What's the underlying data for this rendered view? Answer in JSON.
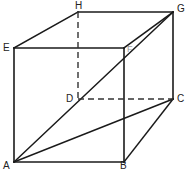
{
  "figure": {
    "background_color": "#ffffff",
    "stroke_color": "#1a1a1a",
    "dashed_stroke_color": "#333333",
    "width": 187,
    "height": 171
  },
  "labels": {
    "A": "A",
    "B": "B",
    "C": "C",
    "D": "D",
    "E": "E",
    "F": "F",
    "G": "G",
    "H": "H"
  },
  "chart_data": {
    "type": "diagram",
    "vertices": [
      {
        "name": "A",
        "x": 14,
        "y": 162,
        "hidden": false,
        "label_x": 3,
        "label_y": 161
      },
      {
        "name": "B",
        "x": 124,
        "y": 162,
        "hidden": false,
        "label_x": 120,
        "label_y": 161
      },
      {
        "name": "C",
        "x": 173,
        "y": 99,
        "hidden": false,
        "label_x": 177,
        "label_y": 94
      },
      {
        "name": "D",
        "x": 78,
        "y": 99,
        "hidden": true,
        "label_x": 66,
        "label_y": 94
      },
      {
        "name": "E",
        "x": 14,
        "y": 48,
        "hidden": false,
        "label_x": 3,
        "label_y": 43
      },
      {
        "name": "F",
        "x": 124,
        "y": 48,
        "hidden": false,
        "label_x": 127,
        "label_y": 44
      },
      {
        "name": "G",
        "x": 173,
        "y": 12,
        "hidden": false,
        "label_x": 177,
        "label_y": 4
      },
      {
        "name": "H",
        "x": 78,
        "y": 12,
        "hidden": false,
        "label_x": 75,
        "label_y": 1
      }
    ],
    "edges": [
      {
        "from": "A",
        "to": "B",
        "style": "solid"
      },
      {
        "from": "B",
        "to": "F",
        "style": "solid"
      },
      {
        "from": "F",
        "to": "E",
        "style": "solid"
      },
      {
        "from": "E",
        "to": "A",
        "style": "solid"
      },
      {
        "from": "E",
        "to": "H",
        "style": "solid"
      },
      {
        "from": "H",
        "to": "G",
        "style": "solid"
      },
      {
        "from": "G",
        "to": "F",
        "style": "solid"
      },
      {
        "from": "G",
        "to": "C",
        "style": "solid"
      },
      {
        "from": "C",
        "to": "B",
        "style": "solid"
      },
      {
        "from": "H",
        "to": "D",
        "style": "dashed"
      },
      {
        "from": "D",
        "to": "C",
        "style": "dashed"
      }
    ],
    "diagonals": [
      {
        "from": "A",
        "to": "G",
        "style": "solid",
        "note": "space diagonal through D region"
      },
      {
        "from": "A",
        "to": "C",
        "style": "solid",
        "note": "base diagonal"
      }
    ],
    "legend": [],
    "grid": false
  }
}
